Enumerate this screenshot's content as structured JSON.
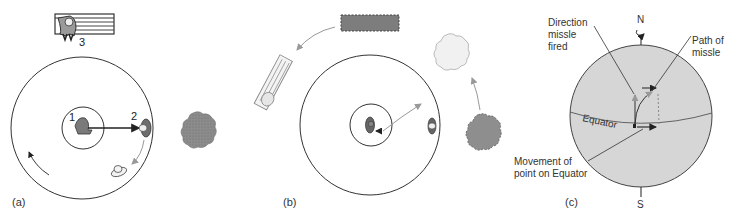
{
  "panels": {
    "a": {
      "label": "(a)",
      "marker_1": "1",
      "marker_2": "2",
      "marker_3": "3"
    },
    "b": {
      "label": "(b)"
    },
    "c": {
      "label": "(c)",
      "north": "N",
      "south": "S",
      "equator": "Equator",
      "direction_fired_1": "Direction",
      "direction_fired_2": "missle",
      "direction_fired_3": "fired",
      "path_1": "Path of",
      "path_2": "missle",
      "movement_1": "Movement of",
      "movement_2": "point on Equator"
    }
  },
  "colors": {
    "line": "#333333",
    "sphere_fill": "#d9d9d9",
    "dark_fill": "#8a8a8a",
    "light_fill": "#eeeeee",
    "arrow_gray": "#888888"
  }
}
